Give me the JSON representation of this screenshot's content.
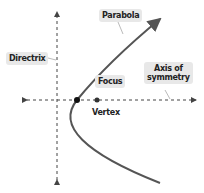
{
  "diagram": {
    "labels": {
      "parabola": "Parabola",
      "directrix": "Directrix",
      "focus": "Focus",
      "axis_line1": "Axis of",
      "axis_line2": "symmetry",
      "vertex": "Vertex"
    },
    "colors": {
      "curve": "#555555",
      "axes": "#444444",
      "points": "#111111",
      "label_bg": "#e8e8e8"
    }
  }
}
